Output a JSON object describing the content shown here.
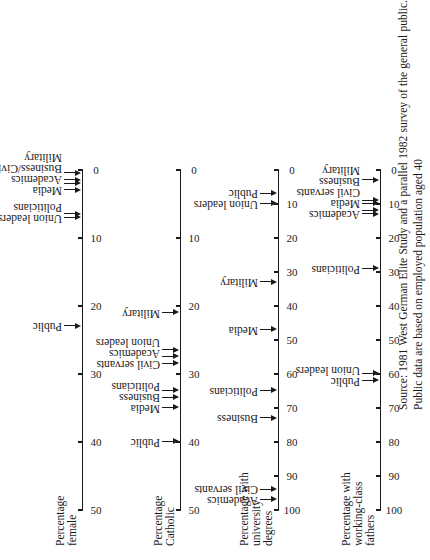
{
  "chart_data": [
    {
      "type": "scatter",
      "title": "Percentage female",
      "xlim": [
        50,
        0
      ],
      "ticks": [
        "50",
        "40",
        "30",
        "20",
        "10",
        "0"
      ],
      "points": [
        {
          "label": "Public",
          "value": 23
        },
        {
          "label": "Union leaders",
          "value": 7
        },
        {
          "label": "Politicians",
          "value": 6.5
        },
        {
          "label": "Media",
          "value": 3
        },
        {
          "label": "Academics",
          "value": 2
        },
        {
          "label": "Business/Civil servants",
          "value": 1.5
        },
        {
          "label": "Military",
          "value": 0.5
        }
      ]
    },
    {
      "type": "scatter",
      "title": "Percentage Catholic",
      "xlim": [
        50,
        0
      ],
      "ticks": [
        "50",
        "40",
        "30",
        "20",
        "10",
        "0"
      ],
      "points": [
        {
          "label": "Public",
          "value": 40
        },
        {
          "label": "Media",
          "value": 35
        },
        {
          "label": "Business",
          "value": 33.5
        },
        {
          "label": "Politicians",
          "value": 32.5
        },
        {
          "label": "Civil servants",
          "value": 28.5
        },
        {
          "label": "Academics",
          "value": 27.5
        },
        {
          "label": "Union leaders",
          "value": 26.5
        },
        {
          "label": "Military",
          "value": 21
        }
      ]
    },
    {
      "type": "scatter",
      "title": "Percentage with university degrees",
      "xlim": [
        100,
        0
      ],
      "ticks": [
        "100",
        "90",
        "80",
        "70",
        "60",
        "50",
        "40",
        "30",
        "20",
        "10",
        "0"
      ],
      "points": [
        {
          "label": "Academics",
          "value": 97
        },
        {
          "label": "Civil servants",
          "value": 94
        },
        {
          "label": "Business",
          "value": 73
        },
        {
          "label": "Politicians",
          "value": 65
        },
        {
          "label": "Media",
          "value": 47
        },
        {
          "label": "Military",
          "value": 33
        },
        {
          "label": "Union leaders",
          "value": 10
        },
        {
          "label": "Public",
          "value": 7
        }
      ]
    },
    {
      "type": "scatter",
      "title": "Percentage with working-class fathers",
      "xlim": [
        100,
        0
      ],
      "ticks": [
        "100",
        "90",
        "80",
        "70",
        "60",
        "50",
        "40",
        "30",
        "20",
        "10",
        "0"
      ],
      "points": [
        {
          "label": "Public",
          "value": 62
        },
        {
          "label": "Union leaders",
          "value": 60
        },
        {
          "label": "Politicians",
          "value": 29
        },
        {
          "label": "Academics",
          "value": 13
        },
        {
          "label": "Media",
          "value": 12
        },
        {
          "label": "Civil servants",
          "value": 10
        },
        {
          "label": "Business",
          "value": 9
        },
        {
          "label": "Military",
          "value": 3
        }
      ]
    }
  ],
  "panels": [
    {
      "title_lines": [
        "Percentage",
        "female"
      ]
    },
    {
      "title_lines": [
        "Percentage",
        "Catholic"
      ]
    },
    {
      "title_lines": [
        "Percentage with",
        "university",
        "degrees"
      ]
    },
    {
      "title_lines": [
        "Percentage with",
        "working-class",
        "fathers"
      ]
    }
  ],
  "source": "Source: 1981 West German Elite Study and a parallel 1982 survey of the general public. Public data are based on employed population aged 40"
}
